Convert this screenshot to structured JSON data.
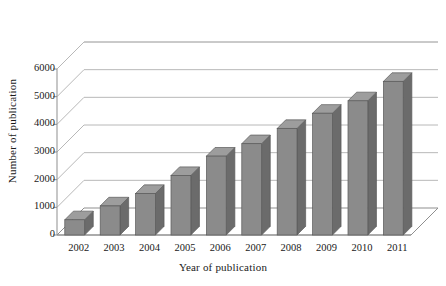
{
  "chart_data": {
    "type": "bar",
    "title": "",
    "subtitle": "",
    "xlabel": "Year of publication",
    "ylabel": "Number of publication",
    "categories": [
      "2002",
      "2003",
      "2004",
      "2005",
      "2006",
      "2007",
      "2008",
      "2009",
      "2010",
      "2011"
    ],
    "values": [
      550,
      1050,
      1500,
      2150,
      2850,
      3300,
      3850,
      4400,
      4850,
      5550
    ],
    "ylim": [
      0,
      6000
    ],
    "yticks": [
      0,
      1000,
      2000,
      3000,
      4000,
      5000,
      6000
    ],
    "ytick_labels": [
      "0",
      "1000",
      "2000",
      "3000",
      "4000",
      "5000",
      "6000"
    ],
    "grid": true,
    "grid_axis": "y",
    "legend": false,
    "legend_position": "none",
    "style": "3d-column",
    "bar_face_color": "#8b8b8b",
    "bar_side_color": "#6b6b6b",
    "bar_top_color": "#9d9d9d",
    "bar_edge_color": "#5a5a5a",
    "grid_color": "#b8b8b8",
    "axis_color": "#8f8f8f",
    "background_color": "#ffffff",
    "plot_background_color": "#ffffff"
  }
}
